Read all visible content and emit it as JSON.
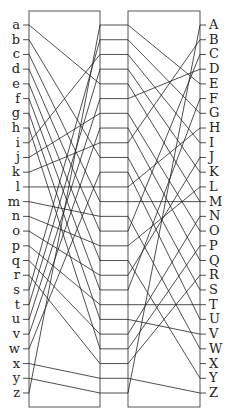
{
  "diagram": {
    "type": "permutation-network",
    "left_labels": [
      "a",
      "b",
      "c",
      "d",
      "e",
      "f",
      "g",
      "h",
      "i",
      "j",
      "k",
      "l",
      "m",
      "n",
      "o",
      "p",
      "q",
      "r",
      "s",
      "t",
      "u",
      "v",
      "w",
      "x",
      "y",
      "z"
    ],
    "right_labels": [
      "A",
      "B",
      "C",
      "D",
      "E",
      "F",
      "G",
      "H",
      "I",
      "J",
      "K",
      "L",
      "M",
      "N",
      "O",
      "P",
      "Q",
      "R",
      "S",
      "T",
      "U",
      "V",
      "W",
      "X",
      "Y",
      "Z"
    ],
    "left_to_slot": [
      4,
      9,
      12,
      14,
      16,
      18,
      20,
      22,
      2,
      6,
      8,
      11,
      13,
      15,
      17,
      19,
      21,
      23,
      1,
      3,
      5,
      7,
      10,
      24,
      25,
      0
    ],
    "slot_to_right": [
      4,
      6,
      8,
      10,
      12,
      3,
      14,
      16,
      1,
      18,
      20,
      7,
      12,
      22,
      2,
      11,
      24,
      9,
      5,
      19,
      21,
      13,
      15,
      17,
      25,
      0
    ],
    "stroke_color": "#222222",
    "box_color": "#555555"
  }
}
